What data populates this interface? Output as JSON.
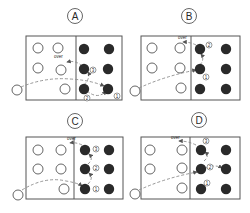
{
  "colors": {
    "ink": "#2a2a2a",
    "box": "#555555",
    "dash": "#8a8a8a",
    "bg": "#ffffff"
  },
  "panels": [
    {
      "label": "A",
      "label_pos": [
        75,
        16
      ],
      "box": [
        26,
        36,
        96,
        64
      ],
      "divider_x": 76,
      "open_circles": [
        [
          38,
          48
        ],
        [
          58,
          48
        ],
        [
          38,
          68
        ],
        [
          61,
          70
        ],
        [
          65,
          89
        ]
      ],
      "filled_circles": [
        [
          84,
          49
        ],
        [
          109,
          49
        ],
        [
          84,
          69
        ],
        [
          108,
          69
        ],
        [
          84,
          89
        ],
        [
          108,
          89
        ]
      ],
      "outside_circle": [
        17,
        90
      ],
      "over_label": {
        "text": "over",
        "pos": [
          54,
          58
        ]
      },
      "step_markers": [
        {
          "n": "3",
          "pos": [
            93,
            70
          ]
        },
        {
          "n": "2",
          "pos": [
            87,
            98
          ]
        },
        {
          "n": "1",
          "pos": [
            117,
            96
          ]
        }
      ],
      "dashed_paths": [
        "M 21 87 Q 45 77 70 79 Q 90 80 104 86",
        "M 87 91 Q 98 100 106 91",
        "M 84 85 Q 91 77 88 72",
        "M 82 66 Q 76 60 67 62"
      ]
    },
    {
      "label": "B",
      "label_pos": [
        189,
        16
      ],
      "box": [
        141,
        36,
        99,
        64
      ],
      "divider_x": 191,
      "open_circles": [
        [
          152,
          48
        ],
        [
          180,
          48
        ],
        [
          152,
          68
        ],
        [
          180,
          68
        ],
        [
          181,
          88
        ]
      ],
      "filled_circles": [
        [
          200,
          49
        ],
        [
          226,
          49
        ],
        [
          200,
          69
        ],
        [
          226,
          69
        ],
        [
          200,
          89
        ],
        [
          226,
          89
        ]
      ],
      "outside_circle": [
        135,
        91
      ],
      "over_label": {
        "text": "over",
        "pos": [
          178,
          39
        ]
      },
      "step_markers": [
        {
          "n": "2",
          "pos": [
            209,
            45
          ]
        },
        {
          "n": "1",
          "pos": [
            206,
            77
          ]
        }
      ],
      "dashed_paths": [
        "M 139 88 Q 165 76 196 70",
        "M 200 65 Q 205 59 201 54",
        "M 196 45 Q 190 42 183 42"
      ]
    },
    {
      "label": "C",
      "label_pos": [
        75,
        121
      ],
      "box": [
        26,
        137,
        97,
        62
      ],
      "divider_x": 74,
      "open_circles": [
        [
          38,
          150
        ],
        [
          61,
          150
        ],
        [
          38,
          169
        ],
        [
          61,
          169
        ],
        [
          64,
          189
        ]
      ],
      "filled_circles": [
        [
          85,
          150
        ],
        [
          109,
          150
        ],
        [
          85,
          169
        ],
        [
          109,
          169
        ],
        [
          85,
          189
        ],
        [
          109,
          189
        ]
      ],
      "outside_circle": [
        18,
        195
      ],
      "over_label": {
        "text": "over",
        "pos": [
          67,
          140
        ]
      },
      "step_markers": [
        {
          "n": "3",
          "pos": [
            96,
            149
          ]
        },
        {
          "n": "2",
          "pos": [
            96,
            168
          ]
        },
        {
          "n": "1",
          "pos": [
            96,
            189
          ]
        }
      ],
      "dashed_paths": [
        "M 22 190 Q 45 176 66 181 Q 78 183 82 186",
        "M 88 184 Q 94 178 89 173",
        "M 88 164 Q 94 159 89 154",
        "M 82 145 Q 76 142 70 143"
      ]
    },
    {
      "label": "D",
      "label_pos": [
        199,
        120
      ],
      "box": [
        141,
        137,
        99,
        62
      ],
      "divider_x": 190,
      "open_circles": [
        [
          150,
          150
        ],
        [
          182,
          150
        ],
        [
          150,
          169
        ],
        [
          182,
          168
        ],
        [
          182,
          188
        ]
      ],
      "filled_circles": [
        [
          201,
          150
        ],
        [
          226,
          150
        ],
        [
          201,
          169
        ],
        [
          226,
          169
        ],
        [
          201,
          189
        ],
        [
          226,
          189
        ]
      ],
      "outside_circle": [
        135,
        194
      ],
      "over_label": {
        "text": "over",
        "pos": [
          171,
          139
        ]
      },
      "step_markers": [
        {
          "n": "3",
          "pos": [
            206,
            141
          ]
        },
        {
          "n": "2",
          "pos": [
            210,
            167
          ]
        },
        {
          "n": "1",
          "pos": [
            207,
            183
          ]
        }
      ],
      "dashed_paths": [
        "M 139 190 Q 165 178 197 172",
        "M 206 168 Q 215 164 222 168",
        "M 204 161 Q 210 156 205 152",
        "M 196 145 Q 188 141 179 141"
      ]
    }
  ]
}
